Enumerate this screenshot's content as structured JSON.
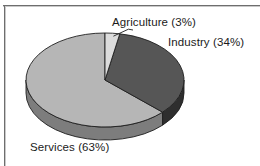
{
  "chart_data": {
    "type": "pie",
    "title": "",
    "subtitle": "",
    "xlabel": "",
    "ylabel": "",
    "legend_position": "none",
    "grid": false,
    "three_d": true,
    "categories": [
      "Agriculture",
      "Industry",
      "Services"
    ],
    "values": [
      3,
      34,
      63
    ],
    "units": "percent",
    "slices": [
      {
        "name": "Agriculture",
        "value": 3,
        "label": "Agriculture (3%)",
        "color": "#dcdcdc",
        "side_color": "#a8a8a8",
        "start_angle_deg": 0,
        "end_angle_deg": 10.8,
        "has_leader_line": true
      },
      {
        "name": "Industry",
        "value": 34,
        "label": "Industry (34%)",
        "color": "#565656",
        "side_color": "#2e2e2e",
        "start_angle_deg": 10.8,
        "end_angle_deg": 133.2,
        "has_leader_line": false
      },
      {
        "name": "Services",
        "value": 63,
        "label": "Services (63%)",
        "color": "#b6b6b6",
        "side_color": "#7d7d7d",
        "start_angle_deg": 133.2,
        "end_angle_deg": 360,
        "has_leader_line": false
      }
    ],
    "annotations": [
      {
        "name": "agriculture-callout",
        "text": "Agriculture (3%)"
      },
      {
        "name": "industry-callout",
        "text": "Industry (34%)"
      },
      {
        "name": "services-callout",
        "text": "Services (63%)"
      }
    ],
    "palette": {
      "agriculture": "#dcdcdc",
      "industry": "#565656",
      "services": "#b6b6b6",
      "outline": "#1f1f1f",
      "background": "#ffffff",
      "frame": "#6e6e6e"
    }
  },
  "figure": {
    "background_color": "#ffffff",
    "frame_color": "#6e6e6e"
  }
}
